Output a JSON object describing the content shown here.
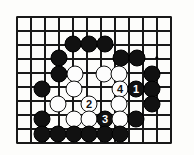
{
  "diagram": {
    "board": {
      "style": "go-board-grid",
      "line_color": "#1a1a1a",
      "background_color": "#fdfdfb",
      "cell_size": 14,
      "origin_x": 17,
      "origin_y": 17,
      "cols": 12,
      "rows": 10,
      "right_edge_x": 171,
      "top_edge_y": 17,
      "bottom_edge_y": 143,
      "left_edge_x": 17
    },
    "star_points": [
      {
        "name": "hoshi-upper-right",
        "x": 157,
        "y": 58
      }
    ],
    "colors": {
      "black_stone": "#111111",
      "white_stone": "#fdfdfd",
      "stone_outline": "#111111",
      "black_label_text": "#ffffff",
      "white_label_text": "#111111"
    },
    "stones": [
      {
        "name": "black-stone",
        "color": "black",
        "x": 73,
        "y": 44,
        "label": ""
      },
      {
        "name": "black-stone",
        "color": "black",
        "x": 89,
        "y": 44,
        "label": ""
      },
      {
        "name": "black-stone",
        "color": "black",
        "x": 105,
        "y": 44,
        "label": ""
      },
      {
        "name": "black-stone",
        "color": "black",
        "x": 59,
        "y": 58,
        "label": ""
      },
      {
        "name": "black-stone",
        "color": "black",
        "x": 121,
        "y": 58,
        "label": ""
      },
      {
        "name": "black-stone",
        "color": "black",
        "x": 137,
        "y": 58,
        "label": ""
      },
      {
        "name": "black-stone",
        "color": "black",
        "x": 59,
        "y": 74,
        "label": ""
      },
      {
        "name": "white-stone",
        "color": "white",
        "x": 75,
        "y": 74,
        "label": ""
      },
      {
        "name": "white-stone",
        "color": "white",
        "x": 104,
        "y": 74,
        "label": ""
      },
      {
        "name": "white-stone",
        "color": "white",
        "x": 119,
        "y": 74,
        "label": ""
      },
      {
        "name": "black-stone",
        "color": "black",
        "x": 152,
        "y": 74,
        "label": ""
      },
      {
        "name": "black-stone",
        "color": "black",
        "x": 42,
        "y": 89,
        "label": ""
      },
      {
        "name": "white-stone",
        "color": "white",
        "x": 74,
        "y": 89,
        "label": ""
      },
      {
        "name": "white-stone-move-4",
        "color": "white",
        "x": 120,
        "y": 89,
        "label": "4"
      },
      {
        "name": "black-stone-move-1",
        "color": "black",
        "x": 136,
        "y": 89,
        "label": "1"
      },
      {
        "name": "black-stone",
        "color": "black",
        "x": 152,
        "y": 89,
        "label": ""
      },
      {
        "name": "white-stone",
        "color": "white",
        "x": 58,
        "y": 104,
        "label": ""
      },
      {
        "name": "white-stone-move-2",
        "color": "white",
        "x": 89,
        "y": 104,
        "label": "2"
      },
      {
        "name": "white-stone",
        "color": "white",
        "x": 119,
        "y": 104,
        "label": ""
      },
      {
        "name": "black-stone",
        "color": "black",
        "x": 152,
        "y": 104,
        "label": ""
      },
      {
        "name": "black-stone",
        "color": "black",
        "x": 42,
        "y": 119,
        "label": ""
      },
      {
        "name": "white-stone",
        "color": "white",
        "x": 74,
        "y": 119,
        "label": ""
      },
      {
        "name": "white-stone",
        "color": "white",
        "x": 89,
        "y": 119,
        "label": ""
      },
      {
        "name": "black-stone-move-3",
        "color": "black",
        "x": 105,
        "y": 119,
        "label": "3"
      },
      {
        "name": "white-stone",
        "color": "white",
        "x": 120,
        "y": 119,
        "label": ""
      },
      {
        "name": "black-stone",
        "color": "black",
        "x": 136,
        "y": 119,
        "label": ""
      },
      {
        "name": "black-stone",
        "color": "black",
        "x": 42,
        "y": 134,
        "label": ""
      },
      {
        "name": "black-stone",
        "color": "black",
        "x": 58,
        "y": 134,
        "label": ""
      },
      {
        "name": "black-stone",
        "color": "black",
        "x": 74,
        "y": 134,
        "label": ""
      },
      {
        "name": "black-stone",
        "color": "black",
        "x": 89,
        "y": 134,
        "label": ""
      },
      {
        "name": "black-stone",
        "color": "black",
        "x": 105,
        "y": 134,
        "label": ""
      },
      {
        "name": "black-stone",
        "color": "black",
        "x": 120,
        "y": 134,
        "label": ""
      }
    ]
  }
}
